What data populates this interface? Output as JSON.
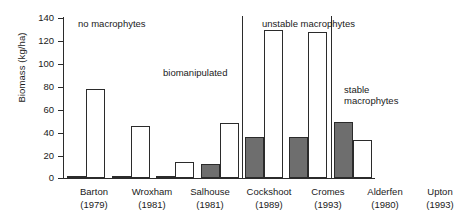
{
  "chart_data": {
    "type": "bar",
    "title": "",
    "xlabel": "",
    "ylabel": "Biomass (kg/ha)",
    "ylim": [
      0,
      140
    ],
    "yticks": [
      0,
      20,
      40,
      60,
      80,
      100,
      120,
      140
    ],
    "ytick_labels": [
      "0",
      "20",
      "40",
      "60",
      "80",
      "100",
      "120",
      "140"
    ],
    "grid": false,
    "legend": "none",
    "categories": [
      "Barton (1979)",
      "Wroxham (1981)",
      "Salhouse (1981)",
      "Cockshoot (1989)",
      "Cromes (1993)",
      "Alderfen (1980)",
      "Upton (1993)"
    ],
    "series": [
      {
        "name": "dark",
        "color": "#6e6e6e",
        "values": [
          0.5,
          0.5,
          2,
          12,
          36,
          36,
          49
        ]
      },
      {
        "name": "white",
        "color": "#ffffff",
        "values": [
          77,
          45,
          14,
          48,
          129,
          127,
          33
        ]
      }
    ],
    "annotations": [
      {
        "text": "no macrophytes"
      },
      {
        "text": "biomanipulated"
      },
      {
        "text": "unstable macrophytes"
      },
      {
        "text": "stable"
      },
      {
        "text": "macrophytes"
      }
    ]
  },
  "axis": {
    "ylabel": "Biomass (kg/ha)",
    "ticks": [
      {
        "label": "140"
      },
      {
        "label": "120"
      },
      {
        "label": "100"
      },
      {
        "label": "80"
      },
      {
        "label": "60"
      },
      {
        "label": "40"
      },
      {
        "label": "20"
      },
      {
        "label": "0"
      }
    ]
  },
  "xlabels": [
    {
      "name": "Barton",
      "year": "(1979)"
    },
    {
      "name": "Wroxham",
      "year": "(1981)"
    },
    {
      "name": "Salhouse",
      "year": "(1981)"
    },
    {
      "name": "Cockshoot",
      "year": "(1989)"
    },
    {
      "name": "Cromes",
      "year": "(1993)"
    },
    {
      "name": "Alderfen",
      "year": "(1980)"
    },
    {
      "name": "Upton",
      "year": "(1993)"
    }
  ],
  "annotations": {
    "no_macrophytes": "no macrophytes",
    "biomanipulated": "biomanipulated",
    "unstable_macrophytes": "unstable macrophytes",
    "stable_line1": "stable",
    "stable_line2": "macrophytes"
  }
}
